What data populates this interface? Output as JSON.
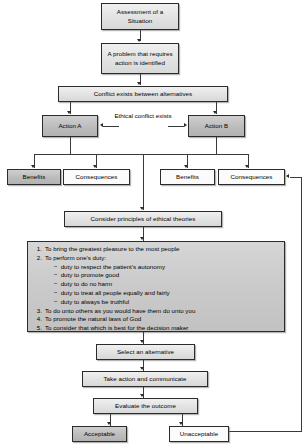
{
  "diagram": {
    "nodes": {
      "assessment": "Assessment of a Situation",
      "problem": "A problem that requires action is identified",
      "conflict": "Conflict exists between alternatives",
      "action_a": "Action A",
      "action_b": "Action B",
      "benefits_a": "Benefits",
      "consequences_a": "Consequences",
      "benefits_b": "Benefits",
      "consequences_b": "Consequences",
      "consider": "Consider principles of ethical theories",
      "select": "Select an alternative",
      "take_action": "Take action and communicate",
      "evaluate": "Evaluate the outcome",
      "acceptable": "Acceptable",
      "unacceptable": "Unacceptable"
    },
    "annotations": {
      "ethical_conflict": "Ethical conflict exists"
    },
    "principles": [
      {
        "num": "1.",
        "text": "To bring the greatest pleasure to the most people",
        "subs": []
      },
      {
        "num": "2.",
        "text": "To perform one's duty:",
        "subs": [
          "duty to respect the patient's autonomy",
          "duty to promote good",
          "duty to do no harm",
          "duty to treat all people equally and fairly",
          "duty to always be truthful"
        ]
      },
      {
        "num": "3.",
        "text": "To do unto others as you would have them do unto you",
        "subs": []
      },
      {
        "num": "4.",
        "text": "To promote the natural laws of God",
        "subs": []
      },
      {
        "num": "5.",
        "text": "To consider that which is best for the decision maker",
        "subs": []
      }
    ],
    "colors": {
      "stroke": "#2b2b2b",
      "fill_light": "#e2e2e2",
      "fill_dark": "#bcbcbc",
      "background": "#ffffff"
    }
  }
}
